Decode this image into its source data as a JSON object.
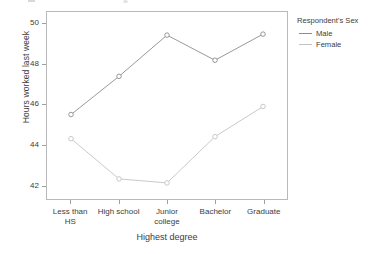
{
  "chart_data": {
    "type": "line",
    "title": "",
    "xlabel": "Highest degree",
    "ylabel": "Hours worked last week",
    "categories": [
      "Less than HS",
      "High school",
      "Junior college",
      "Bachelor",
      "Graduate"
    ],
    "category_lines": [
      [
        "Less than",
        "HS"
      ],
      [
        "High school"
      ],
      [
        "Junior",
        "college"
      ],
      [
        "Bachelor"
      ],
      [
        "Graduate"
      ]
    ],
    "ylim": [
      41.3,
      50.6
    ],
    "yticks": [
      42,
      44,
      46,
      48,
      50
    ],
    "ytick_labels": [
      "42",
      "44",
      "46",
      "48",
      "50"
    ],
    "grid": false,
    "legend_position": "right",
    "marker": "open-circle",
    "series": [
      {
        "name": "Male",
        "color": "#8c8c8c",
        "values": [
          45.5,
          47.4,
          49.45,
          48.2,
          49.5
        ]
      },
      {
        "name": "Female",
        "color": "#c2c2c2",
        "values": [
          44.3,
          42.3,
          42.1,
          44.4,
          45.9
        ]
      }
    ]
  },
  "legend": {
    "title": "Respondent's Sex",
    "items": [
      {
        "label": "Male",
        "color": "#8c8c8c"
      },
      {
        "label": "Female",
        "color": "#c2c2c2"
      }
    ]
  },
  "axes": {
    "y_title": "Hours worked last week",
    "x_title": "Highest degree"
  },
  "colors": {
    "panel_border": "#b9b9b9",
    "tick": "#9f9f9f",
    "text": "#3d3d3d",
    "male": "#8c8c8c",
    "female": "#c2c2c2",
    "background": "#ffffff"
  }
}
